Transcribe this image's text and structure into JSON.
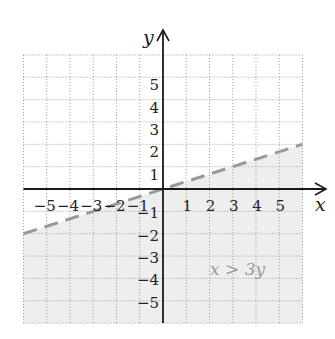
{
  "chart_data": {
    "type": "line",
    "title": "",
    "xlabel": "x",
    "ylabel": "y",
    "xlim": [
      -6,
      6
    ],
    "ylim": [
      -6,
      6
    ],
    "grid": true,
    "x_tick_labels": [
      "-5",
      "-4",
      "-3",
      "-2",
      "-1",
      "1",
      "2",
      "3",
      "4",
      "5"
    ],
    "y_tick_labels": [
      "5",
      "4",
      "3",
      "2",
      "1",
      "-1",
      "-2",
      "-3",
      "-4",
      "-5"
    ],
    "series": [
      {
        "name": "boundary x = 3y",
        "style": "dashed",
        "color": "#999999",
        "x": [
          -6,
          6
        ],
        "y": [
          -2,
          2
        ]
      }
    ],
    "shaded_region": {
      "inequality": "x > 3y",
      "side": "below boundary line",
      "color": "#eeeeee"
    },
    "annotations": [
      {
        "text": "x > 3y",
        "x": 3.5,
        "y": -3.6
      }
    ]
  },
  "labels": {
    "x_axis": "x",
    "y_axis": "y",
    "region": "x > 3y"
  },
  "colors": {
    "grid": "#9a9a9a",
    "axis": "#1a1a1a",
    "shade": "#eeeeee",
    "boundary": "#999999",
    "region_label": "#9a9a9a"
  }
}
